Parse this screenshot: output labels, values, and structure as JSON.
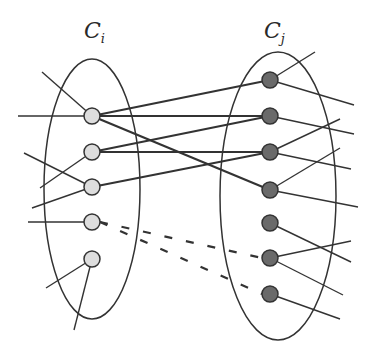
{
  "labels": {
    "left_cluster": {
      "base": "C",
      "sub": "i"
    },
    "right_cluster": {
      "base": "C",
      "sub": "j"
    }
  },
  "colors": {
    "left_node_fill": "#dddddd",
    "right_node_fill": "#6a6a6a",
    "stroke": "#333333",
    "background": "#ffffff"
  },
  "clusters": [
    {
      "id": "Ci",
      "cx": 92,
      "cy": 189,
      "rx": 48,
      "ry": 130
    },
    {
      "id": "Cj",
      "cx": 278,
      "cy": 196,
      "rx": 58,
      "ry": 144
    }
  ],
  "left_nodes": [
    {
      "x": 92,
      "y": 116
    },
    {
      "x": 92,
      "y": 152
    },
    {
      "x": 92,
      "y": 187
    },
    {
      "x": 92,
      "y": 222
    },
    {
      "x": 92,
      "y": 259
    }
  ],
  "right_nodes": [
    {
      "x": 270,
      "y": 80
    },
    {
      "x": 270,
      "y": 116
    },
    {
      "x": 270,
      "y": 152
    },
    {
      "x": 270,
      "y": 190
    },
    {
      "x": 270,
      "y": 223
    },
    {
      "x": 270,
      "y": 258
    },
    {
      "x": 270,
      "y": 294
    }
  ],
  "inter_edges_solid": [
    [
      0,
      0
    ],
    [
      0,
      1
    ],
    [
      0,
      3
    ],
    [
      1,
      1
    ],
    [
      1,
      2
    ],
    [
      2,
      2
    ]
  ],
  "inter_edges_dashed": [
    [
      3,
      5
    ],
    [
      3,
      6
    ]
  ],
  "external_edges": [
    {
      "from": [
        92,
        116
      ],
      "to": [
        42,
        72
      ]
    },
    {
      "from": [
        92,
        116
      ],
      "to": [
        18,
        116
      ]
    },
    {
      "from": [
        92,
        152
      ],
      "to": [
        40,
        188
      ]
    },
    {
      "from": [
        92,
        187
      ],
      "to": [
        24,
        153
      ]
    },
    {
      "from": [
        92,
        187
      ],
      "to": [
        32,
        208
      ]
    },
    {
      "from": [
        92,
        222
      ],
      "to": [
        28,
        222
      ]
    },
    {
      "from": [
        92,
        259
      ],
      "to": [
        46,
        288
      ]
    },
    {
      "from": [
        92,
        259
      ],
      "to": [
        74,
        330
      ]
    },
    {
      "from": [
        270,
        80
      ],
      "to": [
        315,
        52
      ]
    },
    {
      "from": [
        270,
        80
      ],
      "to": [
        354,
        105
      ]
    },
    {
      "from": [
        270,
        116
      ],
      "to": [
        354,
        134
      ]
    },
    {
      "from": [
        270,
        152
      ],
      "to": [
        340,
        119
      ]
    },
    {
      "from": [
        270,
        152
      ],
      "to": [
        351,
        169
      ]
    },
    {
      "from": [
        270,
        190
      ],
      "to": [
        340,
        148
      ]
    },
    {
      "from": [
        270,
        190
      ],
      "to": [
        358,
        207
      ]
    },
    {
      "from": [
        270,
        223
      ],
      "to": [
        351,
        262
      ]
    },
    {
      "from": [
        270,
        258
      ],
      "to": [
        351,
        241
      ]
    },
    {
      "from": [
        270,
        258
      ],
      "to": [
        343,
        295
      ]
    },
    {
      "from": [
        270,
        294
      ],
      "to": [
        340,
        319
      ]
    }
  ]
}
